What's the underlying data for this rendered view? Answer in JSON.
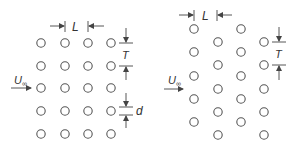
{
  "figure": {
    "colors": {
      "stroke": "#444444",
      "text": "#333333",
      "background": "#ffffff"
    },
    "inline_arrangement": {
      "label_L": "L",
      "label_T": "T",
      "label_d": "d",
      "label_U": "U",
      "label_U_sub": "∞",
      "columns": 4,
      "rows": 5,
      "col_x": [
        41,
        65,
        88,
        111
      ],
      "row_y": [
        43,
        66,
        88,
        111,
        134
      ]
    },
    "staggered_arrangement": {
      "label_L": "L",
      "label_T": "T",
      "label_U": "U",
      "label_U_sub": "∞",
      "columns": 4,
      "col_x": [
        194,
        218,
        241,
        264
      ],
      "odd_col_y": [
        29,
        52,
        76,
        99,
        122
      ],
      "even_col_y": [
        42,
        65,
        89,
        112,
        135
      ]
    }
  }
}
